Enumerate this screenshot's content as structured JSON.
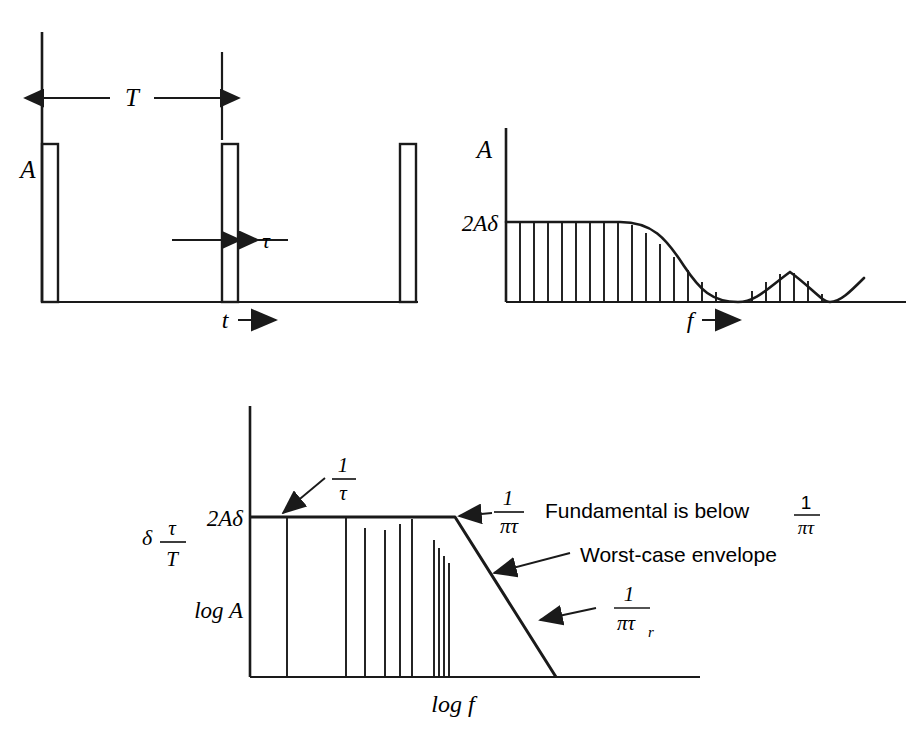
{
  "figure": {
    "type": "technical-diagram",
    "stroke_color": "#1a1a1a",
    "background_color": "#ffffff"
  },
  "panel_time": {
    "name": "time-domain-pulse-train",
    "y_axis_label": "A",
    "x_axis_label": "t",
    "x_axis_arrow": "⟶",
    "period_label": "T",
    "width_label": "τ",
    "pulses": [
      {
        "index": 1,
        "x": 42,
        "width": 16
      },
      {
        "index": 2,
        "x": 222,
        "width": 16
      },
      {
        "index": 3,
        "x": 400,
        "width": 16
      }
    ],
    "amplitude_top_y": 144,
    "baseline_y": 302,
    "period_arrow_y": 98,
    "tau_arrow_y": 240
  },
  "panel_spectrum": {
    "name": "line-spectrum-sinc-envelope",
    "y_axis_label": "A",
    "y_tick_label": "2Aδ",
    "x_axis_label": "f",
    "x_axis_arrow": "⟶",
    "plateau_value_y": 222,
    "baseline_y": 302,
    "first_null_x": 738,
    "second_null_x": 830,
    "lobe_peak_x": 790,
    "line_spacing_px": 14,
    "envelope_shape": "sinc"
  },
  "panel_log": {
    "name": "log-log-worst-case-envelope",
    "y_axis_tick_label": "2Aδ",
    "y_axis_label": "log A",
    "x_axis_label": "log f",
    "delta_definition_numerator": "τ",
    "delta_definition_denominator": "T",
    "delta_symbol": "δ",
    "plateau_y": 517,
    "baseline_y": 677,
    "breakpoint_x": 455,
    "envelope_end_x": 556,
    "harmonic_lines_x": [
      287,
      346,
      365,
      385,
      400,
      412,
      434,
      439,
      444,
      449
    ],
    "annotations": [
      {
        "id": "break-1-over-tau",
        "numerator": "1",
        "denominator": "τ",
        "text": ""
      },
      {
        "id": "break-1-over-pi-tau",
        "numerator": "1",
        "denominator": "πτ",
        "text": ""
      },
      {
        "id": "fundamental-note",
        "text": "Fundamental is below",
        "numerator": "1",
        "denominator": "πτ"
      },
      {
        "id": "worst-case-envelope",
        "text": "Worst-case envelope"
      },
      {
        "id": "break-1-over-pi-tau-r",
        "numerator": "1",
        "denominator": "πτ",
        "subscript": "r"
      }
    ]
  }
}
